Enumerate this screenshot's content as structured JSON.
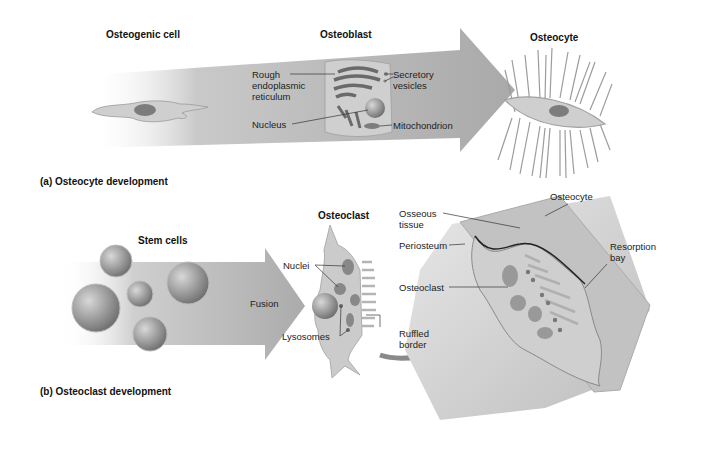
{
  "panel_a": {
    "caption": "(a) Osteocyte development",
    "stages": {
      "osteogenic": "Osteogenic cell",
      "osteoblast": "Osteoblast",
      "osteocyte": "Osteocyte"
    },
    "labels": {
      "rough_er_1": "Rough",
      "rough_er_2": "endoplasmic",
      "rough_er_3": "reticulum",
      "nucleus": "Nucleus",
      "secretory_1": "Secretory",
      "secretory_2": "vesicles",
      "mitochondrion": "Mitochondrion"
    }
  },
  "panel_b": {
    "caption": "(b) Osteoclast development",
    "stages": {
      "stem_cells": "Stem cells",
      "fusion": "Fusion",
      "osteoclast": "Osteoclast"
    },
    "labels": {
      "nuclei": "Nuclei",
      "lysosomes": "Lysosomes",
      "ruffled_1": "Ruffled",
      "ruffled_2": "border",
      "osseous_1": "Osseous",
      "osseous_2": "tissue",
      "periosteum": "Periosteum",
      "osteoclast_inset": "Osteoclast",
      "osteocyte_inset": "Osteocyte",
      "resorption_1": "Resorption",
      "resorption_2": "bay"
    }
  },
  "colors": {
    "arrow": "#b5b5b5",
    "cell": "#c8c8c8",
    "nucleus": "#8a8a8a",
    "bone": "#d6d6d6"
  }
}
